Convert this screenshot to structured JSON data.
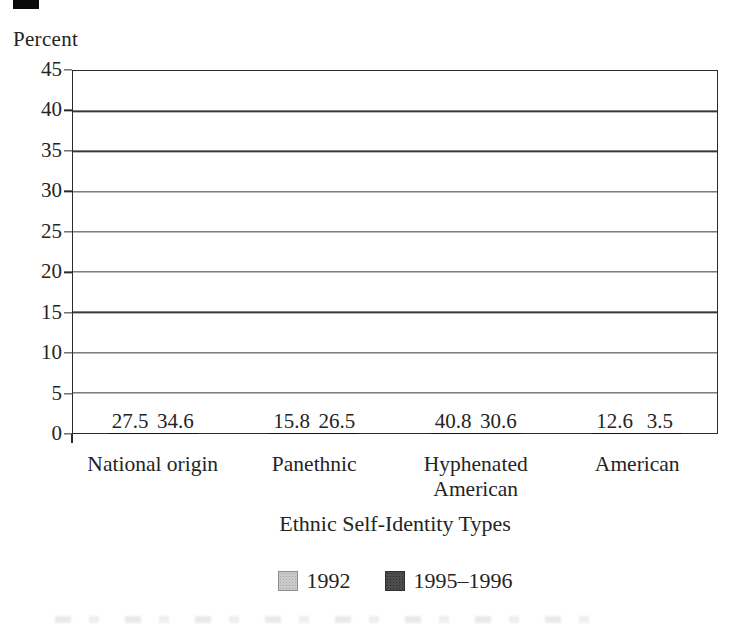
{
  "figure": {
    "background": "#ffffff",
    "text_color": "#242424",
    "scan_artifact": "black bar, top-left corner"
  },
  "chart_data": {
    "type": "bar",
    "title": "",
    "ylabel": "Percent",
    "xlabel": "Ethnic Self-Identity Types",
    "categories": [
      "National origin",
      "Panethnic",
      "Hyphenated American",
      "American"
    ],
    "series": [
      {
        "name": "1992",
        "values": [
          27.5,
          15.8,
          40.8,
          12.6
        ],
        "color": "#c9c9c9"
      },
      {
        "name": "1995–1996",
        "values": [
          34.6,
          26.5,
          30.6,
          3.5
        ],
        "color": "#4d4d4d"
      }
    ],
    "ylim": [
      0,
      45
    ],
    "yticks": [
      45,
      40,
      35,
      30,
      25,
      20,
      15,
      10,
      5,
      0
    ],
    "grid": true,
    "value_labels": true,
    "legend_position": "bottom"
  }
}
